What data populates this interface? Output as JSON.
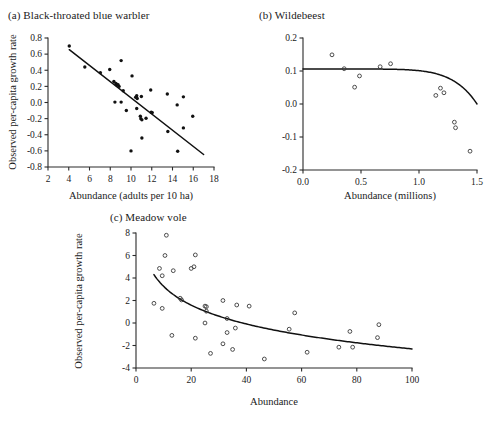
{
  "figure": {
    "caption_style": "multi-panel scientific scatter figure",
    "background_color": "#ffffff",
    "ink_color": "#1a1a1a"
  },
  "panels": [
    {
      "id": "a",
      "title": "(a) Black-throated blue warbler",
      "marker": "filled",
      "xlabel": "Abundance (adults per 10 ha)",
      "ylabel": "Observed per-capita growth rate"
    },
    {
      "id": "b",
      "title": "(b) Wildebeest",
      "marker": "open",
      "xlabel": "Abundance (millions)",
      "ylabel": ""
    },
    {
      "id": "c",
      "title": "(c) Meadow vole",
      "marker": "open",
      "xlabel": "Abundance",
      "ylabel": "Observed per-capita growth rate"
    }
  ],
  "chart_data": [
    {
      "panel": "a",
      "type": "scatter",
      "title": "(a) Black-throated blue warbler",
      "xlabel": "Abundance (adults per 10 ha)",
      "ylabel": "Observed per-capita growth rate",
      "xlim": [
        2,
        18
      ],
      "ylim": [
        -0.8,
        0.8
      ],
      "xticks": [
        2,
        4,
        6,
        8,
        10,
        12,
        14,
        16,
        18
      ],
      "xtick_labels": [
        "2",
        "4",
        "6",
        "8",
        "10",
        "12",
        "14",
        "16",
        "18"
      ],
      "yticks": [
        -0.8,
        -0.6,
        -0.4,
        -0.2,
        0.0,
        0.2,
        0.4,
        0.6,
        0.8
      ],
      "ytick_labels": [
        "-0.8",
        "-0.6",
        "-0.4",
        "-0.2",
        "0.0",
        "0.2",
        "0.4",
        "0.6",
        "0.8"
      ],
      "grid": false,
      "legend": null,
      "marker_style": "filled-circle",
      "points": [
        [
          4.05,
          0.7
        ],
        [
          5.55,
          0.44
        ],
        [
          7.05,
          0.37
        ],
        [
          7.95,
          0.41
        ],
        [
          8.35,
          0.26
        ],
        [
          8.55,
          0.235
        ],
        [
          8.65,
          0.22
        ],
        [
          8.75,
          0.22
        ],
        [
          8.85,
          0.2
        ],
        [
          9.05,
          0.52
        ],
        [
          8.45,
          0.005
        ],
        [
          9.05,
          0.005
        ],
        [
          9.25,
          0.145
        ],
        [
          9.55,
          -0.1
        ],
        [
          10.1,
          0.33
        ],
        [
          10.45,
          0.065
        ],
        [
          10.55,
          0.085
        ],
        [
          10.6,
          0.05
        ],
        [
          10.55,
          -0.075
        ],
        [
          10.9,
          -0.17
        ],
        [
          11.0,
          0.075
        ],
        [
          10.95,
          -0.2
        ],
        [
          11.05,
          -0.215
        ],
        [
          11.45,
          -0.195
        ],
        [
          11.05,
          -0.44
        ],
        [
          10.0,
          -0.6
        ],
        [
          11.9,
          0.155
        ],
        [
          11.95,
          -0.12
        ],
        [
          12.05,
          -0.125
        ],
        [
          13.5,
          0.105
        ],
        [
          13.55,
          -0.36
        ],
        [
          14.45,
          -0.03
        ],
        [
          14.5,
          -0.605
        ],
        [
          15.05,
          0.07
        ],
        [
          15.05,
          -0.315
        ],
        [
          15.95,
          -0.17
        ]
      ],
      "fit": {
        "kind": "linear",
        "x_start": 4.05,
        "x_end": 17.0,
        "y_start": 0.655,
        "y_end": -0.645,
        "description": "negative linear regression line"
      }
    },
    {
      "panel": "b",
      "type": "scatter",
      "title": "(b) Wildebeest",
      "xlabel": "Abundance (millions)",
      "ylabel": "",
      "xlim": [
        0.0,
        1.5
      ],
      "ylim": [
        -0.2,
        0.2
      ],
      "xticks": [
        0.0,
        0.5,
        1.0,
        1.5
      ],
      "xtick_labels": [
        "0.0",
        "0.5",
        "1.0",
        "1.5"
      ],
      "yticks": [
        -0.2,
        -0.1,
        0.0,
        0.1,
        0.2
      ],
      "ytick_labels": [
        "-0.2",
        "-0.1",
        "0.0",
        "0.1",
        "0.2"
      ],
      "grid": false,
      "legend": null,
      "marker_style": "open-circle",
      "points": [
        [
          0.25,
          0.149
        ],
        [
          0.355,
          0.107
        ],
        [
          0.445,
          0.051
        ],
        [
          0.487,
          0.085
        ],
        [
          0.665,
          0.113
        ],
        [
          0.755,
          0.122
        ],
        [
          1.145,
          0.026
        ],
        [
          1.185,
          0.048
        ],
        [
          1.215,
          0.034
        ],
        [
          1.305,
          -0.055
        ],
        [
          1.315,
          -0.072
        ],
        [
          1.44,
          -0.143
        ]
      ],
      "fit": {
        "kind": "theta-logistic",
        "plateau_y": 0.106,
        "x_breakpoint": 0.85,
        "x_end": 1.5,
        "y_end": -0.2,
        "description": "flat then steeply declining curve (theta-logistic)"
      }
    },
    {
      "panel": "c",
      "type": "scatter",
      "title": "(c) Meadow vole",
      "xlabel": "Abundance",
      "ylabel": "Observed per-capita growth rate",
      "xlim": [
        0,
        100
      ],
      "ylim": [
        -4,
        8
      ],
      "xticks": [
        0,
        20,
        40,
        60,
        80,
        100
      ],
      "xtick_labels": [
        "0",
        "20",
        "40",
        "60",
        "80",
        "100"
      ],
      "yticks": [
        -4,
        -2,
        0,
        2,
        4,
        6,
        8
      ],
      "ytick_labels": [
        "-4",
        "-2",
        "0",
        "2",
        "4",
        "6",
        "8"
      ],
      "grid": false,
      "legend": null,
      "marker_style": "open-circle",
      "points": [
        [
          11.0,
          7.8
        ],
        [
          10.5,
          6.0
        ],
        [
          21.5,
          6.05
        ],
        [
          8.5,
          4.85
        ],
        [
          13.5,
          4.65
        ],
        [
          20.0,
          4.85
        ],
        [
          9.5,
          4.2
        ],
        [
          21.0,
          5.0
        ],
        [
          6.5,
          1.75
        ],
        [
          9.5,
          1.3
        ],
        [
          16.0,
          2.2
        ],
        [
          16.5,
          2.05
        ],
        [
          25.0,
          1.5
        ],
        [
          25.5,
          1.45
        ],
        [
          31.5,
          2.0
        ],
        [
          25.5,
          1.05
        ],
        [
          36.5,
          1.6
        ],
        [
          41.0,
          1.5
        ],
        [
          25.0,
          0.0
        ],
        [
          33.0,
          0.4
        ],
        [
          36.0,
          -0.45
        ],
        [
          33.0,
          -0.85
        ],
        [
          13.0,
          -1.1
        ],
        [
          21.5,
          -1.35
        ],
        [
          31.5,
          -1.85
        ],
        [
          27.0,
          -2.7
        ],
        [
          35.0,
          -2.35
        ],
        [
          46.5,
          -3.2
        ],
        [
          57.5,
          0.9
        ],
        [
          62.0,
          -2.6
        ],
        [
          73.5,
          -2.15
        ],
        [
          78.5,
          -2.15
        ],
        [
          77.5,
          -0.75
        ],
        [
          87.5,
          -1.3
        ],
        [
          88.0,
          -0.15
        ],
        [
          55.5,
          -0.55
        ]
      ],
      "fit": {
        "kind": "power-decay",
        "x_start": 6.5,
        "x_end": 100,
        "y_start": 4.3,
        "y_end": -2.3,
        "description": "monotonically decreasing concave-up curve"
      }
    }
  ]
}
